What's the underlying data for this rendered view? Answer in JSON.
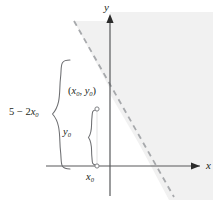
{
  "figure": {
    "axes": {
      "x_label": "x",
      "y_label": "y",
      "origin": {
        "x": 110,
        "y": 166
      }
    },
    "labels": {
      "point_label": "(x₀, y₀)",
      "point_label_parts": {
        "open": "(",
        "x": "x",
        "x_sub": "0",
        "comma": ", ",
        "y": "y",
        "y_sub": "0",
        "close": ")"
      },
      "vertical_segment_label": "y₀",
      "horizontal_position_label": "x₀",
      "brace_expression_label": "5 − 2x₀",
      "brace_expression_parts": {
        "constant": "5",
        "minus": " − ",
        "coefficient": "2",
        "variable": "x",
        "subscript": "0"
      }
    },
    "colors": {
      "axis": "#58595b",
      "dashed_line": "#a7a9ac",
      "shaded_region": "#f1f1f1",
      "brace": "#6d6e71",
      "text": "#231f20",
      "marker_stroke": "#808285",
      "background": "#ffffff"
    },
    "elements": {
      "dashed_boundary": {
        "style": "dashed",
        "description": "boundary line of inequality, negative slope",
        "start": {
          "x": 74,
          "y": 21
        },
        "end": {
          "x": 174,
          "y": 196
        }
      },
      "shaded_half_plane": {
        "description": "region to the right of the dashed line and right of the y-axis",
        "fill": "#f1f1f1"
      },
      "point_marker": {
        "x": 97,
        "y": 109,
        "type": "open-circle"
      },
      "foot_marker": {
        "x": 97,
        "y": 166,
        "type": "open-circle"
      },
      "brace_y0": {
        "from_y": 109,
        "to_y": 166,
        "x": 92
      },
      "brace_expression": {
        "from_y": 60,
        "to_y": 170,
        "x": 56
      }
    }
  }
}
